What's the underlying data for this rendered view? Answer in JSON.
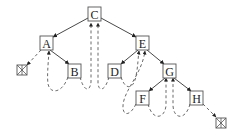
{
  "diagram": {
    "title": "",
    "type": "threaded-binary-tree",
    "nodes": [
      {
        "id": "C",
        "label": "C",
        "cx": 94.5,
        "cy": 14
      },
      {
        "id": "A",
        "label": "A",
        "cx": 46.5,
        "cy": 43
      },
      {
        "id": "E",
        "label": "E",
        "cx": 142.5,
        "cy": 43
      },
      {
        "id": "B",
        "label": "B",
        "cx": 74.5,
        "cy": 71
      },
      {
        "id": "D",
        "label": "D",
        "cx": 114.5,
        "cy": 71
      },
      {
        "id": "G",
        "label": "G",
        "cx": 169.5,
        "cy": 71
      },
      {
        "id": "F",
        "label": "F",
        "cx": 142.5,
        "cy": 98
      },
      {
        "id": "H",
        "label": "H",
        "cx": 196.5,
        "cy": 98
      }
    ],
    "null_markers": [
      {
        "id": "null-left",
        "cx": 22,
        "cy": 70
      },
      {
        "id": "null-right",
        "cx": 221.5,
        "cy": 123
      }
    ],
    "edges": [
      {
        "from": "C",
        "to": "A"
      },
      {
        "from": "C",
        "to": "E"
      },
      {
        "from": "A",
        "to": "B"
      },
      {
        "from": "E",
        "to": "D"
      },
      {
        "from": "E",
        "to": "G"
      },
      {
        "from": "G",
        "to": "F"
      },
      {
        "from": "G",
        "to": "H"
      }
    ],
    "threads": [
      {
        "from": "A",
        "to": "null-left",
        "kind": "left-thread"
      },
      {
        "from": "B",
        "to": "A",
        "kind": "left-thread"
      },
      {
        "from": "B",
        "to": "C",
        "kind": "right-thread"
      },
      {
        "from": "D",
        "to": "C",
        "kind": "left-thread"
      },
      {
        "from": "D",
        "to": "E",
        "kind": "right-thread"
      },
      {
        "from": "F",
        "to": "E",
        "kind": "left-thread"
      },
      {
        "from": "F",
        "to": "G",
        "kind": "right-thread"
      },
      {
        "from": "H",
        "to": "G",
        "kind": "left-thread"
      },
      {
        "from": "H",
        "to": "null-right",
        "kind": "right-thread"
      }
    ],
    "colors": {
      "stroke": "#555555",
      "text": "#222222",
      "background": "#ffffff"
    }
  }
}
